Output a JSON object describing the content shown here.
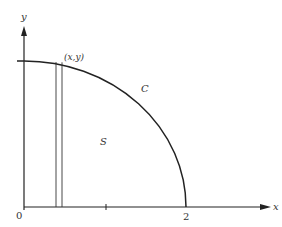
{
  "diagram": {
    "axes": {
      "x_label": "x",
      "y_label": "y",
      "origin_label": "0",
      "x_tick_label": "2"
    },
    "curve_label": "C",
    "region_label": "S",
    "point_label": "(x,y)",
    "colors": {
      "stroke": "#222222",
      "background": "#ffffff"
    }
  }
}
